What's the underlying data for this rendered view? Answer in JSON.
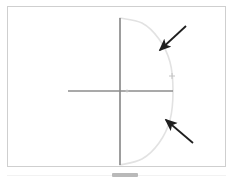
{
  "document": {
    "title": "Semicircular arc diagram with axes and two annotation arrows",
    "background_color": "#ffffff",
    "width": 232,
    "height": 181
  },
  "figure": {
    "frame": {
      "name": "figure-border",
      "color": "#cfcfcf",
      "x": 7,
      "y": 6,
      "width": 219,
      "height": 161
    },
    "caption": ""
  },
  "scrollbar": {
    "thumb_color": "#b9b9b9",
    "track_color": "#f2f2f2",
    "thumb_x": 112,
    "thumb_y": 173,
    "thumb_width": 26
  },
  "chart_data": {
    "type": "line",
    "title": "",
    "subtitle": "",
    "xlabel": "",
    "ylabel": "",
    "grid": false,
    "legend": false,
    "axes": {
      "origin": {
        "x": 120,
        "y": 91
      },
      "color": "#8c8c8c",
      "line_width": 1.6,
      "vertical_axis": {
        "name": "y-axis",
        "x": 120,
        "y_top": 18,
        "y_bottom": 165
      },
      "horizontal_axis": {
        "name": "x-axis",
        "y": 91,
        "x_left": 68,
        "x_right": 173
      },
      "ticks": []
    },
    "series": [
      {
        "name": "arc-curve",
        "description": "light gray semicircular arc bulging to the right, joining the top and bottom of the vertical axis and crossing the horizontal axis at its right end",
        "color": "#e2e2e2",
        "line_width": 1.6,
        "closed": false,
        "points": [
          {
            "x": 120,
            "y": 18
          },
          {
            "x": 142,
            "y": 23
          },
          {
            "x": 159,
            "y": 39
          },
          {
            "x": 170,
            "y": 62
          },
          {
            "x": 173,
            "y": 91
          },
          {
            "x": 170,
            "y": 120
          },
          {
            "x": 159,
            "y": 143
          },
          {
            "x": 142,
            "y": 159
          },
          {
            "x": 120,
            "y": 165
          }
        ]
      }
    ],
    "markers": [
      {
        "name": "curve-point-marker",
        "shape": "plus",
        "x": 172,
        "y": 76,
        "size": 5,
        "color": "#c0c0c0"
      },
      {
        "name": "origin-marker",
        "shape": "dot",
        "x": 127,
        "y": 91,
        "size": 2,
        "color": "#cccccc"
      }
    ],
    "annotations": [
      {
        "name": "upper-arrow",
        "type": "arrow",
        "color": "#1f1f1f",
        "line_width": 1.8,
        "tail": {
          "x": 186,
          "y": 26
        },
        "head": {
          "x": 160,
          "y": 50
        },
        "label": ""
      },
      {
        "name": "lower-arrow",
        "type": "arrow",
        "color": "#1f1f1f",
        "line_width": 1.8,
        "tail": {
          "x": 193,
          "y": 143
        },
        "head": {
          "x": 166,
          "y": 120
        },
        "label": ""
      }
    ],
    "xlim": [
      68,
      226
    ],
    "ylim": [
      18,
      165
    ]
  }
}
